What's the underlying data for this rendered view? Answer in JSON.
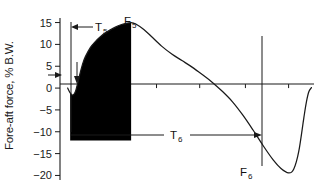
{
  "chart_data": {
    "type": "line",
    "title": "",
    "xlabel": "",
    "ylabel": "Fore-aft force, % B.W.",
    "ylim": [
      -21.5,
      16.5
    ],
    "xlim": [
      0,
      100
    ],
    "grid": false,
    "legend": "none",
    "y_ticks": [
      15,
      10,
      5,
      0,
      -5,
      -10,
      -15,
      -20
    ],
    "y_tick_labels": [
      "15",
      "10",
      "5",
      "0",
      "−5",
      "−10",
      "−15",
      "−20"
    ],
    "x_ticks": [
      38,
      55,
      73,
      90
    ],
    "x_tick_labels": [
      "",
      "",
      "",
      ""
    ],
    "series": [
      {
        "name": "Fore-aft ground reaction force",
        "x": [
          3,
          4,
          5,
          6,
          7,
          8,
          9,
          10,
          12,
          14,
          16,
          18,
          20,
          22,
          24,
          26,
          28,
          30,
          33,
          36,
          40,
          44,
          48,
          52,
          56,
          60,
          64,
          68,
          72,
          76,
          80,
          84,
          87,
          90,
          92,
          94,
          96,
          97,
          98,
          99
        ],
        "y": [
          0,
          -1.1,
          -1.6,
          -0.9,
          1.2,
          3.6,
          5.7,
          7.2,
          9.3,
          10.7,
          11.8,
          12.7,
          13.4,
          14.0,
          14.5,
          14.8,
          15.0,
          14.6,
          13.4,
          11.8,
          9.6,
          7.8,
          6.3,
          4.8,
          3.1,
          1.3,
          -0.8,
          -3.2,
          -6.2,
          -9.6,
          -13.2,
          -16.5,
          -18.4,
          -19.4,
          -18.6,
          -14.5,
          -6.8,
          -3.2,
          -0.8,
          0.1
        ]
      }
    ],
    "filled_region": {
      "label": "impulse-shading",
      "color": "#000000",
      "x_start": 4,
      "x_end": 28,
      "y_floor": -12.0
    },
    "annotations": [
      {
        "name": "T5",
        "base": "T",
        "sub": "5",
        "kind": "interval-label"
      },
      {
        "name": "F5",
        "base": "F",
        "sub": "5",
        "kind": "peak-label",
        "value": 15.0
      },
      {
        "name": "T6",
        "base": "T",
        "sub": "6",
        "kind": "interval-label"
      },
      {
        "name": "F6",
        "base": "F",
        "sub": "6",
        "kind": "trough-label",
        "value": -19.4
      }
    ]
  },
  "axis": {
    "y_label": "Fore-aft force, % B.W.",
    "tick_labels": [
      "15",
      "10",
      "5",
      "0",
      "−5",
      "−10",
      "−15",
      "−20"
    ]
  },
  "labels": {
    "t5_base": "T",
    "t5_sub": "5",
    "f5_base": "F",
    "f5_sub": "5",
    "t6_base": "T",
    "t6_sub": "6",
    "f6_base": "F",
    "f6_sub": "6"
  },
  "colors": {
    "ink": "#1a1a1a",
    "fill": "#000000",
    "background": "#ffffff"
  }
}
